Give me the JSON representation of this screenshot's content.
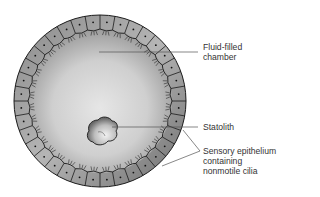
{
  "diagram": {
    "labels": {
      "chamber": [
        "Fluid-filled",
        "chamber"
      ],
      "statolith": "Statolith",
      "epithelium": [
        "Sensory epithelium",
        "containing",
        "nonmotile cilia"
      ]
    },
    "colors": {
      "outline": "#1a1a1a",
      "cell_fill_light": "#e8e8e8",
      "cell_fill_dark": "#7a7a7a",
      "chamber_center": "#e4e4e4",
      "chamber_edge": "#a8a8a8",
      "leader_line": "#555555",
      "text": "#333333"
    },
    "geometry": {
      "cx": 100,
      "cy": 101,
      "r": 86,
      "cell_count": 36
    }
  }
}
